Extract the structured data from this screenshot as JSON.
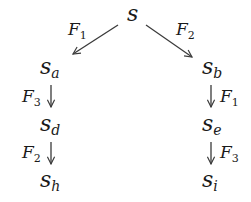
{
  "diagram": {
    "type": "state-tree",
    "root": {
      "base": "s",
      "sub": ""
    },
    "nodes": {
      "s_a": {
        "base": "s",
        "sub": "a"
      },
      "s_b": {
        "base": "s",
        "sub": "b"
      },
      "s_d": {
        "base": "s",
        "sub": "d"
      },
      "s_e": {
        "base": "s",
        "sub": "e"
      },
      "s_h": {
        "base": "s",
        "sub": "h"
      },
      "s_i": {
        "base": "s",
        "sub": "i"
      }
    },
    "edges": {
      "root_to_a": {
        "from": "s",
        "to": "s_a",
        "label_base": "F",
        "label_sub": "1"
      },
      "root_to_b": {
        "from": "s",
        "to": "s_b",
        "label_base": "F",
        "label_sub": "2"
      },
      "a_to_d": {
        "from": "s_a",
        "to": "s_d",
        "label_base": "F",
        "label_sub": "3"
      },
      "d_to_h": {
        "from": "s_d",
        "to": "s_h",
        "label_base": "F",
        "label_sub": "2"
      },
      "b_to_e": {
        "from": "s_b",
        "to": "s_e",
        "label_base": "F",
        "label_sub": "1"
      },
      "e_to_i": {
        "from": "s_e",
        "to": "s_i",
        "label_base": "F",
        "label_sub": "3"
      }
    },
    "colors": {
      "ink": "#1a1a1a",
      "edge": "#3a3a3a",
      "background": "#ffffff"
    }
  }
}
